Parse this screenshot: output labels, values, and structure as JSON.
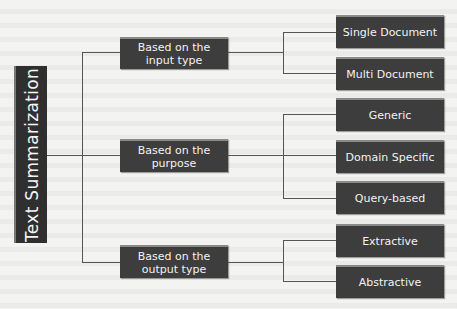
{
  "diagram": {
    "root": {
      "label": "Text Summarization"
    },
    "categories": [
      {
        "label_line1": "Based on the",
        "label_line2": "input type",
        "children": [
          "Single Document",
          "Multi Document"
        ]
      },
      {
        "label_line1": "Based on the",
        "label_line2": "purpose",
        "children": [
          "Generic",
          "Domain Specific",
          "Query-based"
        ]
      },
      {
        "label_line1": "Based on the",
        "label_line2": "output type",
        "children": [
          "Extractive",
          "Abstractive"
        ]
      }
    ]
  },
  "colors": {
    "box": "#3d3d3d",
    "root": "#2f2f2f",
    "text": "#f2f2f2",
    "line": "#555555",
    "background": "#f3f3f1"
  }
}
